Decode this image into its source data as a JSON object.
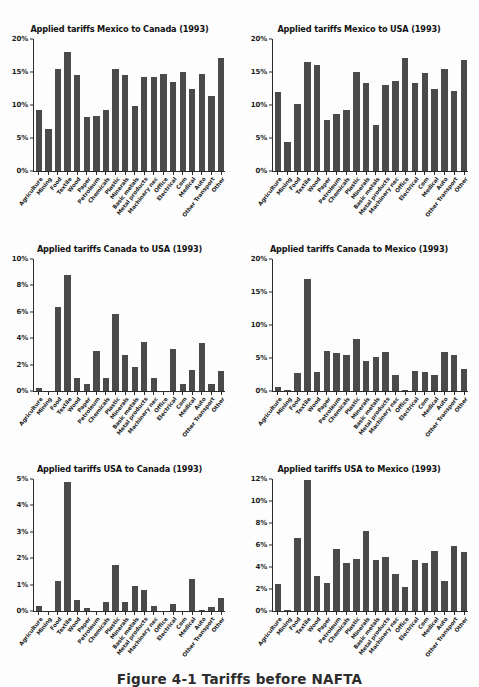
{
  "figure": {
    "caption": "Figure 4-1 Tariffs before NAFTA"
  },
  "categories": [
    "Agriculture",
    "Mining",
    "Food",
    "Textile",
    "Wood",
    "Paper",
    "Petroleum",
    "Chemicals",
    "Plastic",
    "Minerals",
    "Basic metals",
    "Metal products",
    "Machinery nec",
    "Office",
    "Electrical",
    "Com",
    "Medical",
    "Auto",
    "Other Transport",
    "Other"
  ],
  "bar_color": "#4a4a4a",
  "chart_data": [
    {
      "type": "bar",
      "title": "Applied tariffs Mexico to Canada (1993)",
      "xlabel": "",
      "ylabel": "",
      "ylim": [
        0,
        20
      ],
      "yticks": [
        0,
        5,
        10,
        15,
        20
      ],
      "ytick_labels": [
        "0%",
        "5%",
        "10%",
        "15%",
        "20%"
      ],
      "grid": false,
      "legend": "none",
      "categories": [
        "Agriculture",
        "Mining",
        "Food",
        "Textile",
        "Wood",
        "Paper",
        "Petroleum",
        "Chemicals",
        "Plastic",
        "Minerals",
        "Basic metals",
        "Metal products",
        "Machinery nec",
        "Office",
        "Electrical",
        "Com",
        "Medical",
        "Auto",
        "Other Transport",
        "Other"
      ],
      "values": [
        9.2,
        6.3,
        15.4,
        18.1,
        14.6,
        8.2,
        8.3,
        9.3,
        15.4,
        14.5,
        9.9,
        14.3,
        14.2,
        14.7,
        13.5,
        15.0,
        12.5,
        14.7,
        11.4,
        17.1
      ]
    },
    {
      "type": "bar",
      "title": "Applied tariffs Mexico to USA (1993)",
      "xlabel": "",
      "ylabel": "",
      "ylim": [
        0,
        20
      ],
      "yticks": [
        0,
        5,
        10,
        15,
        20
      ],
      "ytick_labels": [
        "0%",
        "5%",
        "10%",
        "15%",
        "20%"
      ],
      "grid": false,
      "legend": "none",
      "categories": [
        "Agriculture",
        "Mining",
        "Food",
        "Textile",
        "Wood",
        "Paper",
        "Petroleum",
        "Chemicals",
        "Plastic",
        "Minerals",
        "Basic metals",
        "Metal products",
        "Machinery nec",
        "Office",
        "Electrical",
        "Com",
        "Medical",
        "Auto",
        "Other Transport",
        "Other"
      ],
      "values": [
        12.0,
        4.4,
        10.2,
        16.5,
        16.0,
        7.8,
        8.6,
        9.2,
        15.0,
        13.4,
        7.0,
        13.1,
        13.7,
        17.1,
        13.4,
        14.8,
        12.4,
        15.5,
        12.1,
        16.8
      ]
    },
    {
      "type": "bar",
      "title": "Applied tariffs Canada to USA (1993)",
      "xlabel": "",
      "ylabel": "",
      "ylim": [
        0,
        10
      ],
      "yticks": [
        0,
        2,
        4,
        6,
        8,
        10
      ],
      "ytick_labels": [
        "0%",
        "2%",
        "4%",
        "6%",
        "8%",
        "10%"
      ],
      "grid": false,
      "legend": "none",
      "categories": [
        "Agriculture",
        "Mining",
        "Food",
        "Textile",
        "Wood",
        "Paper",
        "Petroleum",
        "Chemicals",
        "Plastic",
        "Minerals",
        "Basic metals",
        "Metal products",
        "Machinery nec",
        "Office",
        "Electrical",
        "Com",
        "Medical",
        "Auto",
        "Other Transport",
        "Other"
      ],
      "values": [
        0.25,
        0.0,
        6.35,
        8.8,
        0.95,
        0.5,
        3.05,
        0.95,
        5.8,
        2.75,
        1.85,
        3.75,
        0.95,
        0.0,
        3.2,
        0.55,
        1.6,
        3.6,
        0.55,
        1.55
      ]
    },
    {
      "type": "bar",
      "title": "Applied tariffs Canada to Mexico (1993)",
      "xlabel": "",
      "ylabel": "",
      "ylim": [
        0,
        20
      ],
      "yticks": [
        0,
        5,
        10,
        15,
        20
      ],
      "ytick_labels": [
        "0%",
        "5%",
        "10%",
        "15%",
        "20%"
      ],
      "grid": false,
      "legend": "none",
      "categories": [
        "Agriculture",
        "Mining",
        "Food",
        "Textile",
        "Wood",
        "Paper",
        "Petroleum",
        "Chemicals",
        "Plastic",
        "Minerals",
        "Basic metals",
        "Metal products",
        "Machinery nec",
        "Office",
        "Electrical",
        "Com",
        "Medical",
        "Auto",
        "Other Transport",
        "Other"
      ],
      "values": [
        0.6,
        0.15,
        2.7,
        17.0,
        2.9,
        6.1,
        5.7,
        5.4,
        7.9,
        4.6,
        5.2,
        5.9,
        2.4,
        0.1,
        3.0,
        2.9,
        2.4,
        5.9,
        5.5,
        3.3
      ]
    },
    {
      "type": "bar",
      "title": "Applied tariffs USA to Canada (1993)",
      "xlabel": "",
      "ylabel": "",
      "ylim": [
        0,
        5
      ],
      "yticks": [
        0,
        1,
        2,
        3,
        4,
        5
      ],
      "ytick_labels": [
        "0%",
        "1%",
        "2%",
        "3%",
        "4%",
        "5%"
      ],
      "grid": false,
      "legend": "none",
      "categories": [
        "Agriculture",
        "Mining",
        "Food",
        "Textile",
        "Wood",
        "Paper",
        "Petroleum",
        "Chemicals",
        "Plastic",
        "Minerals",
        "Basic metals",
        "Metal products",
        "Machinery nec",
        "Office",
        "Electrical",
        "Com",
        "Medical",
        "Auto",
        "Other Transport",
        "Other"
      ],
      "values": [
        0.2,
        0.0,
        1.15,
        4.9,
        0.4,
        0.13,
        0.0,
        0.35,
        1.75,
        0.33,
        0.93,
        0.8,
        0.2,
        0.0,
        0.25,
        0.0,
        1.2,
        0.05,
        0.17,
        0.48
      ]
    },
    {
      "type": "bar",
      "title": "Applied tariffs USA to Mexico (1993)",
      "xlabel": "",
      "ylabel": "",
      "ylim": [
        0,
        12
      ],
      "yticks": [
        0,
        2,
        4,
        6,
        8,
        10,
        12
      ],
      "ytick_labels": [
        "0%",
        "2%",
        "4%",
        "6%",
        "8%",
        "10%",
        "12%"
      ],
      "grid": false,
      "legend": "none",
      "categories": [
        "Agriculture",
        "Mining",
        "Food",
        "Textile",
        "Wood",
        "Paper",
        "Petroleum",
        "Chemicals",
        "Plastic",
        "Minerals",
        "Basic metals",
        "Metal products",
        "Machinery nec",
        "Office",
        "Electrical",
        "Com",
        "Medical",
        "Auto",
        "Other Transport",
        "Other"
      ],
      "values": [
        2.5,
        0.05,
        6.6,
        11.9,
        3.15,
        2.55,
        5.6,
        4.4,
        4.7,
        7.25,
        4.65,
        4.9,
        3.4,
        2.15,
        4.65,
        4.35,
        5.5,
        2.7,
        5.95,
        5.35
      ]
    }
  ]
}
